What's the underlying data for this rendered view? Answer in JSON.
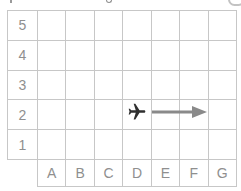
{
  "grid": {
    "row_labels": [
      "5",
      "4",
      "3",
      "2",
      "1"
    ],
    "col_labels": [
      "A",
      "B",
      "C",
      "D",
      "E",
      "F",
      "G"
    ],
    "rows": 5,
    "cols": 7,
    "plane_cell": "D2",
    "arrow": {
      "from": "E2",
      "to": "F2",
      "direction": "right"
    }
  },
  "icons": {
    "plane": "airplane-right-icon",
    "arrow": "right-arrow-icon"
  },
  "colors": {
    "grid_line": "#c7c7c7",
    "label_text": "#8f8f8f",
    "plane": "#2f2f2f",
    "arrow": "#8a8a8a",
    "background": "#ffffff"
  }
}
